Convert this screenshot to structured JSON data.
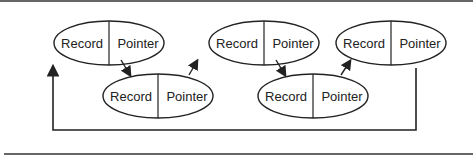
{
  "diagram": {
    "type": "circular-linked-list",
    "nodes": [
      {
        "record_label": "Record",
        "pointer_label": "Pointer",
        "row": "top"
      },
      {
        "record_label": "Record",
        "pointer_label": "Pointer",
        "row": "bottom"
      },
      {
        "record_label": "Record",
        "pointer_label": "Pointer",
        "row": "top"
      },
      {
        "record_label": "Record",
        "pointer_label": "Pointer",
        "row": "bottom"
      },
      {
        "record_label": "Record",
        "pointer_label": "Pointer",
        "row": "top"
      }
    ],
    "links": [
      {
        "from": 0,
        "to": 1
      },
      {
        "from": 1,
        "to": 2
      },
      {
        "from": 2,
        "to": 3
      },
      {
        "from": 3,
        "to": 4
      },
      {
        "from": 4,
        "to": 0,
        "style": "return-loop"
      }
    ],
    "colors": {
      "stroke": "#222222",
      "rule": "#555555",
      "background": "#ffffff"
    }
  }
}
